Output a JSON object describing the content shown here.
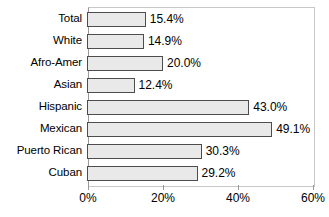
{
  "chart_data": {
    "type": "bar",
    "orientation": "horizontal",
    "title": "",
    "xlabel": "",
    "ylabel": "",
    "categories": [
      "Total",
      "White",
      "Afro-Amer",
      "Asian",
      "Hispanic",
      "Mexican",
      "Puerto Rican",
      "Cuban"
    ],
    "values": [
      15.4,
      14.9,
      20.0,
      12.4,
      43.0,
      49.1,
      30.3,
      29.2
    ],
    "value_labels": [
      "15.4%",
      "14.9%",
      "20.0%",
      "12.4%",
      "43.0%",
      "49.1%",
      "30.3%",
      "29.2%"
    ],
    "xlim": [
      0,
      60
    ],
    "xticks": [
      0,
      20,
      40,
      60
    ],
    "xtick_labels": [
      "0%",
      "20%",
      "40%",
      "60%"
    ],
    "grid": false,
    "legend": null,
    "bar_fill": "#e9e9e9",
    "bar_border": "#4d4d4d",
    "frame_color": "#c8c8c8",
    "text_color": "#000000"
  }
}
